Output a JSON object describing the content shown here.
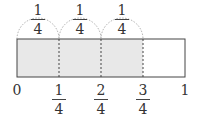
{
  "diagram": {
    "type": "fraction-bar-number-line",
    "total_parts": 4,
    "shaded_parts": 3,
    "shade_color": "#e8e8e8",
    "arc_labels": [
      {
        "num": "1",
        "den": "4"
      },
      {
        "num": "1",
        "den": "4"
      },
      {
        "num": "1",
        "den": "4"
      }
    ],
    "axis_labels": {
      "start": "0",
      "end": "1",
      "ticks": [
        {
          "num": "1",
          "den": "4"
        },
        {
          "num": "2",
          "den": "4"
        },
        {
          "num": "3",
          "den": "4"
        }
      ]
    }
  }
}
